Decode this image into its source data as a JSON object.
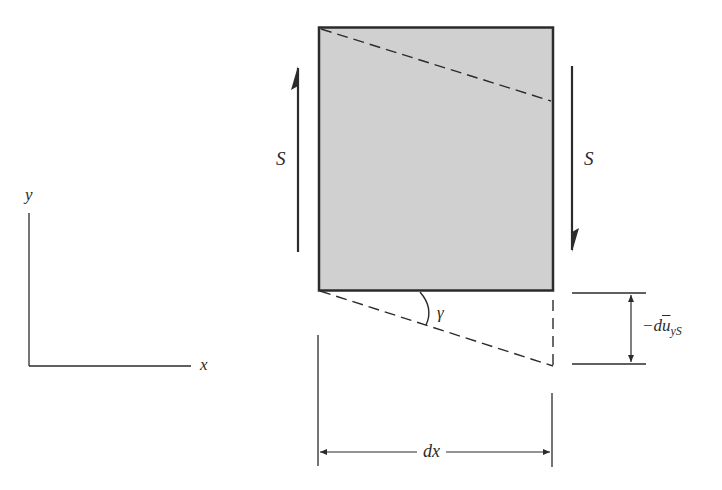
{
  "diagram": {
    "type": "shear deformation of beam element",
    "element": {
      "fill": "#d0d0d0",
      "stroke": "#2b2b2b"
    },
    "labels": {
      "shear_left": "S",
      "shear_right": "S",
      "axis_x": "x",
      "axis_y": "y",
      "angle": "γ",
      "displacement_prefix": "−d",
      "displacement_symbol": "u",
      "displacement_subscript": "yS",
      "width": "dx"
    },
    "colors": {
      "line": "#2b2b2b",
      "background": "#ffffff"
    }
  }
}
